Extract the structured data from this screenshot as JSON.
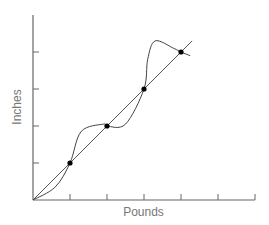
{
  "chart_data": {
    "type": "line",
    "title": "",
    "xlabel": "Pounds",
    "ylabel": "Inches",
    "xlim": [
      0,
      6
    ],
    "ylim": [
      0,
      5
    ],
    "x_ticks": [
      1,
      2,
      3,
      4,
      5,
      6
    ],
    "y_ticks": [
      1,
      2,
      3,
      4
    ],
    "tick_labels_shown": false,
    "grid": false,
    "legend": null,
    "series": [
      {
        "name": "linear fit",
        "style": "straight line",
        "x": [
          0,
          4.3
        ],
        "y": [
          0,
          4.3
        ]
      },
      {
        "name": "curve",
        "style": "smooth curve",
        "x": [
          0,
          0.6,
          1,
          1.3,
          1.9,
          2,
          2.5,
          3,
          3.1,
          3.3,
          3.8,
          4,
          4.25
        ],
        "y": [
          0,
          0.35,
          1,
          1.85,
          2.05,
          2,
          2.05,
          3,
          3.8,
          4.3,
          4.1,
          4,
          3.9
        ]
      },
      {
        "name": "data points",
        "style": "markers",
        "x": [
          1,
          2,
          3,
          4
        ],
        "y": [
          1,
          2,
          3,
          4
        ]
      }
    ]
  },
  "colors": {
    "axis": "#666666",
    "line": "#555555",
    "curve": "#444444",
    "marker": "#000000",
    "label": "#777777"
  }
}
